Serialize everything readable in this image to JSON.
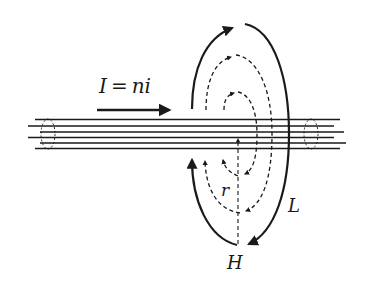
{
  "diagram": {
    "type": "physics-diagram",
    "labels": {
      "current_symbol": "I",
      "equals": "=",
      "current_expr": "ni",
      "radius": "r",
      "loop": "L",
      "field": "H"
    },
    "wires": {
      "count": 6,
      "color": "#1a1a1a"
    },
    "field_loops": [
      {
        "name": "outer-loop-L",
        "style": "solid"
      },
      {
        "name": "middle-loop",
        "style": "dashed"
      },
      {
        "name": "inner-loop",
        "style": "dashed"
      }
    ],
    "colors": {
      "stroke": "#1a1a1a",
      "background": "#ffffff"
    }
  }
}
